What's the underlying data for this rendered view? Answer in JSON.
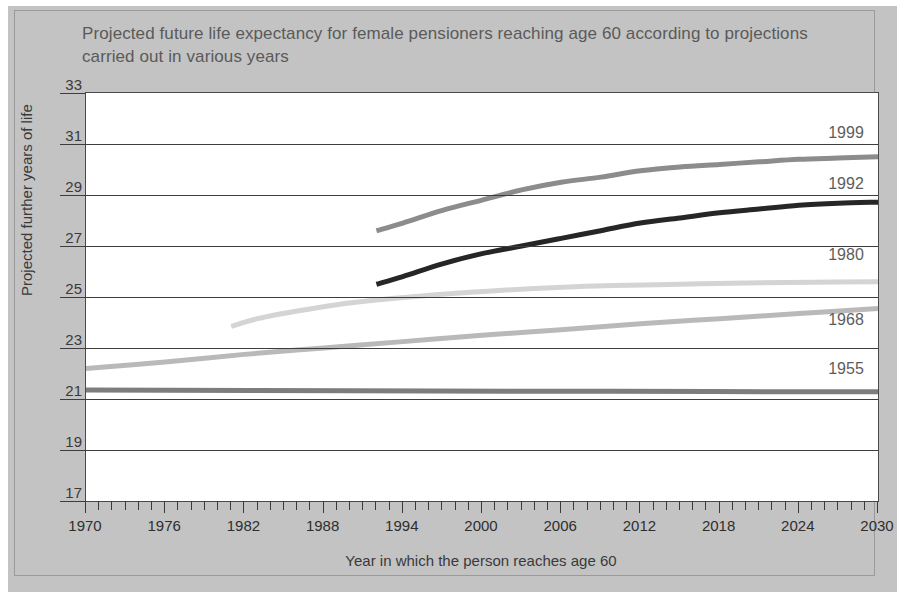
{
  "chart_data": {
    "type": "line",
    "title": "Projected future life expectancy for female pensioners reaching age 60 according to projections carried out in various years",
    "xlabel": "Year in which the person reaches age 60",
    "ylabel": "Projected further years of life",
    "xlim": [
      1970,
      2030
    ],
    "ylim": [
      17,
      33
    ],
    "x_tick_labels": [
      1970,
      1976,
      1982,
      1988,
      1994,
      2000,
      2006,
      2012,
      2018,
      2024,
      2030
    ],
    "x_tick_step": 1,
    "y_tick_labels": [
      17,
      19,
      21,
      23,
      25,
      27,
      29,
      31,
      33
    ],
    "grid": "horizontal",
    "legend_position": "right-inline-labels",
    "series": [
      {
        "name": "1999",
        "color": "#8c8c8c",
        "label_x": 2029,
        "label_y": 31.4,
        "x": [
          1992,
          1994,
          1997,
          2000,
          2003,
          2006,
          2009,
          2012,
          2015,
          2018,
          2021,
          2024,
          2027,
          2030
        ],
        "values": [
          27.6,
          27.9,
          28.4,
          28.8,
          29.2,
          29.5,
          29.7,
          29.95,
          30.1,
          30.2,
          30.3,
          30.4,
          30.45,
          30.5
        ]
      },
      {
        "name": "1992",
        "color": "#262626",
        "label_x": 2029,
        "label_y": 29.4,
        "x": [
          1992,
          1994,
          1997,
          2000,
          2003,
          2006,
          2009,
          2012,
          2015,
          2018,
          2021,
          2024,
          2027,
          2030
        ],
        "values": [
          25.5,
          25.8,
          26.3,
          26.7,
          27.0,
          27.3,
          27.6,
          27.9,
          28.1,
          28.3,
          28.45,
          28.6,
          28.68,
          28.72
        ]
      },
      {
        "name": "1980",
        "color": "#d4d4d4",
        "label_x": 2029,
        "label_y": 26.6,
        "x": [
          1981,
          1983,
          1986,
          1989,
          1992,
          1995,
          1998,
          2001,
          2004,
          2007,
          2010,
          2015,
          2020,
          2025,
          2030
        ],
        "values": [
          23.85,
          24.15,
          24.45,
          24.7,
          24.88,
          25.02,
          25.15,
          25.25,
          25.33,
          25.4,
          25.45,
          25.5,
          25.55,
          25.58,
          25.6
        ]
      },
      {
        "name": "1968",
        "color": "#b9b9b9",
        "label_x": 2029,
        "label_y": 24.05,
        "x": [
          1970,
          1976,
          1982,
          1988,
          1994,
          2000,
          2006,
          2012,
          2018,
          2024,
          2030
        ],
        "values": [
          22.2,
          22.45,
          22.75,
          23.0,
          23.25,
          23.5,
          23.72,
          23.95,
          24.15,
          24.35,
          24.55
        ]
      },
      {
        "name": "1955",
        "color": "#7d7d7d",
        "label_x": 2029,
        "label_y": 22.15,
        "x": [
          1970,
          1990,
          2010,
          2030
        ],
        "values": [
          21.35,
          21.32,
          21.3,
          21.28
        ]
      }
    ]
  }
}
